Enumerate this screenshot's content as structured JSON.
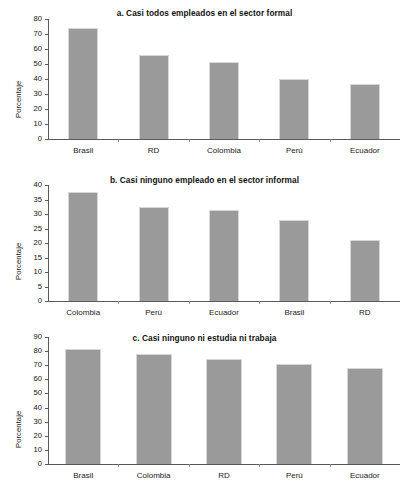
{
  "figure": {
    "ylabel": "Porcentaje"
  },
  "chart_data": [
    {
      "type": "bar",
      "title": "a. Casi todos empleados en el sector formal",
      "categories": [
        "Brasil",
        "RD",
        "Colombia",
        "Perú",
        "Ecuador"
      ],
      "values": [
        74,
        56,
        51.5,
        40,
        36.5
      ],
      "ticks": [
        0,
        10,
        20,
        30,
        40,
        50,
        60,
        70,
        80
      ],
      "ylim": [
        0,
        80
      ],
      "xlabel": "",
      "ylabel": "Porcentaje",
      "grid": false,
      "legend": "none",
      "bar_color": "#9a9a9a"
    },
    {
      "type": "bar",
      "title": "b. Casi ninguno empleado en el sector informal",
      "categories": [
        "Colombia",
        "Perú",
        "Ecuador",
        "Brasil",
        "RD"
      ],
      "values": [
        37.5,
        32.5,
        31.5,
        28,
        21
      ],
      "ticks": [
        0,
        5,
        10,
        15,
        20,
        25,
        30,
        35,
        40
      ],
      "ylim": [
        0,
        40
      ],
      "xlabel": "",
      "ylabel": "Porcentaje",
      "grid": false,
      "legend": "none",
      "bar_color": "#9a9a9a"
    },
    {
      "type": "bar",
      "title": "c. Casi ninguno ni estudia ni trabaja",
      "categories": [
        "Brasil",
        "Colombia",
        "RD",
        "Perú",
        "Ecuador"
      ],
      "values": [
        81.5,
        78,
        74.5,
        71,
        68
      ],
      "ticks": [
        0,
        10,
        20,
        30,
        40,
        50,
        60,
        70,
        80,
        90
      ],
      "ylim": [
        0,
        90
      ],
      "xlabel": "",
      "ylabel": "Porcentaje",
      "grid": false,
      "legend": "none",
      "bar_color": "#9a9a9a"
    }
  ]
}
